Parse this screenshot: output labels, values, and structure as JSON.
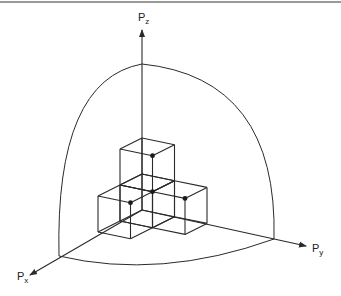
{
  "diagram": {
    "type": "3d-axes-with-cube-stack",
    "axes": [
      {
        "id": "px",
        "label": "P",
        "subscript": "x"
      },
      {
        "id": "py",
        "label": "P",
        "subscript": "y"
      },
      {
        "id": "pz",
        "label": "P",
        "subscript": "z"
      }
    ],
    "origin": [
      142,
      210
    ],
    "unit": {
      "x": [
        -22,
        11
      ],
      "y": [
        32.5,
        6.7
      ],
      "z": [
        0,
        -36
      ]
    },
    "axis_tips": {
      "px": [
        30,
        275
      ],
      "py": [
        306,
        246
      ],
      "pz": [
        142,
        30
      ]
    },
    "sphere_octant_points": {
      "x_end": [
        59,
        256
      ],
      "y_end": [
        274,
        239
      ],
      "z_end": [
        142,
        64
      ]
    },
    "cubes": [
      {
        "pos": [
          0,
          0,
          0
        ]
      },
      {
        "pos": [
          1,
          0,
          0
        ]
      },
      {
        "pos": [
          0,
          1,
          0
        ]
      },
      {
        "pos": [
          0,
          0,
          1
        ]
      }
    ],
    "dots": [
      [
        1,
        1,
        1
      ],
      [
        2,
        1,
        1
      ],
      [
        1,
        2,
        1
      ],
      [
        1,
        1,
        2
      ]
    ],
    "line_color": "#2a2a2a"
  }
}
